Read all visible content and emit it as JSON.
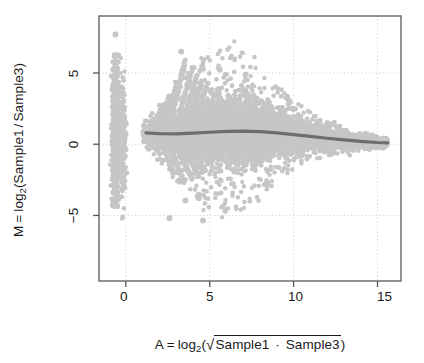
{
  "figure": {
    "kind": "MA-plot",
    "background": "#ffffff",
    "frame_color": "#585858",
    "point_color": "#c6c6c6",
    "loess_color": "#6e6e6e",
    "grid_color": "#c9c9c9",
    "text_color": "#1a1a1a"
  },
  "axes": {
    "x": {
      "label_parts": {
        "var": "A",
        "equals": "=",
        "log": "log",
        "base": "2",
        "open_paren": "(",
        "radical": "√",
        "term1": "Sample1",
        "dot": "·",
        "term2": "Sample3",
        "close_paren": ")"
      },
      "label_text": "A = log2( √(Sample1 · Sample3) )",
      "ticks": [
        "0",
        "5",
        "10",
        "15"
      ],
      "tick_values": [
        0,
        5,
        10,
        15
      ],
      "range": [
        -1.6,
        16.4
      ]
    },
    "y": {
      "label_parts": {
        "var": "M",
        "equals": "=",
        "log": "log",
        "base": "2",
        "open_paren": "(",
        "term1": "Sample1",
        "slash": "/",
        "term2": "Sample3",
        "close_paren": ")"
      },
      "label_text": "M = log2(Sample1 / Sample3)",
      "ticks": [
        "5",
        "0",
        "−5"
      ],
      "tick_values": [
        5,
        0,
        -5
      ],
      "range": [
        -9.6,
        9.0
      ]
    }
  },
  "chart_data": {
    "type": "scatter",
    "title": "",
    "xlabel": "A = log2(sqrt(Sample1 * Sample3))",
    "ylabel": "M = log2(Sample1 / Sample3)",
    "xlim": [
      -1.6,
      16.4
    ],
    "ylim": [
      -9.6,
      9.0
    ],
    "xticks": [
      0,
      5,
      10,
      15
    ],
    "yticks": [
      -5,
      0,
      5
    ],
    "grid": true,
    "grid_style": "dotted",
    "legend": null,
    "series": [
      {
        "name": "genes",
        "type": "scatter",
        "color": "#c6c6c6",
        "marker": "circle",
        "marker_size": 2.2,
        "n_points_approx": 18000,
        "description": "Dense MA cloud: narrow funnel widening from A~1 to A~5, maximum spread M in [-4,+4] near A=5-7, progressively narrowing to M~0 by A=15.5; plus a dense vertical stripe of zero-count genes at A~-0.6 spanning M from -4 to +6 with discrete horizontal striations, and several diagonal 'ray' fans rising from A~2 to A~5 at M from +1 to +6."
      },
      {
        "name": "loess trend",
        "type": "line",
        "color": "#6e6e6e",
        "width": 3.2,
        "x": [
          1.2,
          2.0,
          3.0,
          4.0,
          5.0,
          6.0,
          7.0,
          8.0,
          9.0,
          10.0,
          11.0,
          12.0,
          13.0,
          14.0,
          15.0,
          15.6
        ],
        "y": [
          0.8,
          0.74,
          0.72,
          0.78,
          0.84,
          0.9,
          0.92,
          0.88,
          0.8,
          0.68,
          0.55,
          0.42,
          0.3,
          0.2,
          0.12,
          0.1
        ]
      },
      {
        "name": "zero reference",
        "type": "hline",
        "y": 0,
        "color": "#c9c9c9",
        "style": "dotted"
      }
    ],
    "notable_outliers": [
      {
        "x": -0.62,
        "y": 7.7
      },
      {
        "x": 3.3,
        "y": 6.5
      },
      {
        "x": 4.55,
        "y": 5.45
      },
      {
        "x": 5.6,
        "y": 5.25
      },
      {
        "x": 2.6,
        "y": -5.2
      },
      {
        "x": 4.6,
        "y": -5.35
      },
      {
        "x": 3.55,
        "y": -3.95
      },
      {
        "x": 4.35,
        "y": -3.8
      }
    ]
  }
}
